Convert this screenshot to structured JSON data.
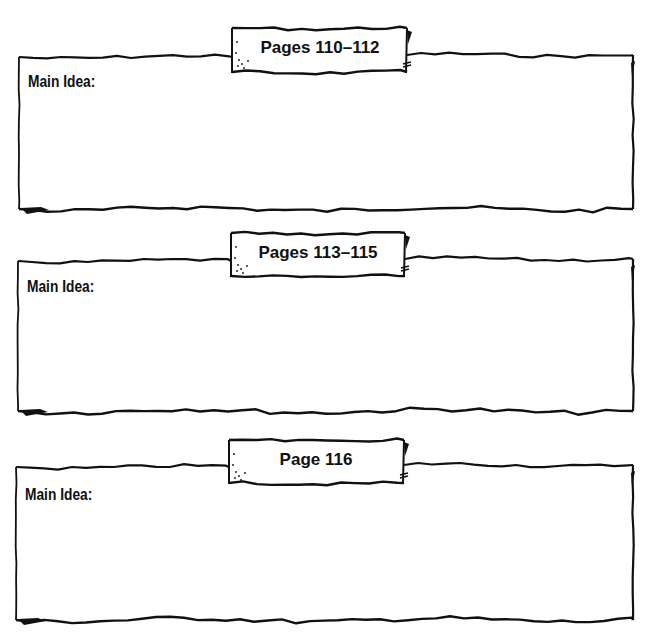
{
  "sections": [
    {
      "banner": "Pages 110–112",
      "label": "Main Idea:",
      "answer": ""
    },
    {
      "banner": "Pages 113–115",
      "label": "Main Idea:",
      "answer": ""
    },
    {
      "banner": "Page 116",
      "label": "Main Idea:",
      "answer": ""
    }
  ],
  "colors": {
    "ink": "#111111",
    "paper": "#ffffff"
  }
}
